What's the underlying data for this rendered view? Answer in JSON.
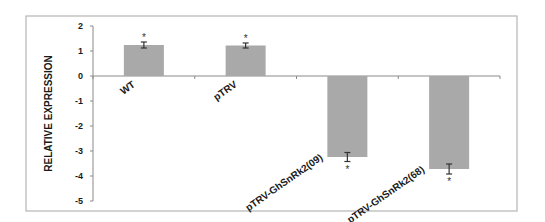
{
  "chart_data": {
    "type": "bar",
    "title": "",
    "xlabel": "",
    "ylabel": "RELATIVE EXPRESSION",
    "ylim": [
      -5,
      2
    ],
    "yticks": [
      2,
      1,
      0,
      -1,
      -2,
      -3,
      -4,
      -5
    ],
    "categories": [
      "WT",
      "pTRV",
      "pTRV-GhSnRk2(09)",
      "pTRV-GhSnRk2(68)"
    ],
    "values": [
      1.24,
      1.22,
      -3.24,
      -3.72
    ],
    "errors": [
      0.12,
      0.1,
      0.18,
      0.2
    ],
    "significance": [
      "*",
      "*",
      "*",
      "*"
    ],
    "bar_color": "#a9a9a9",
    "grid": false,
    "legend": "none"
  }
}
